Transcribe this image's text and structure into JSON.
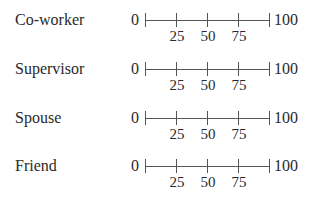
{
  "scales": [
    {
      "label": "Co-worker",
      "min": "0",
      "max": "100",
      "ticks": [
        "25",
        "50",
        "75"
      ]
    },
    {
      "label": "Supervisor",
      "min": "0",
      "max": "100",
      "ticks": [
        "25",
        "50",
        "75"
      ]
    },
    {
      "label": "Spouse",
      "min": "0",
      "max": "100",
      "ticks": [
        "25",
        "50",
        "75"
      ]
    },
    {
      "label": "Friend",
      "min": "0",
      "max": "100",
      "ticks": [
        "25",
        "50",
        "75"
      ]
    }
  ]
}
